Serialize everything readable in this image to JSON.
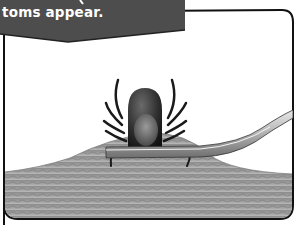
{
  "banner": {
    "text": "toms appear.",
    "background_color": "#4d4d4d",
    "text_color": "#ffffff"
  },
  "illustration": {
    "subject": "tick on skin with tweezers",
    "elements": [
      "tick",
      "tweezers",
      "skin-surface"
    ],
    "frame_color": "#111111"
  }
}
